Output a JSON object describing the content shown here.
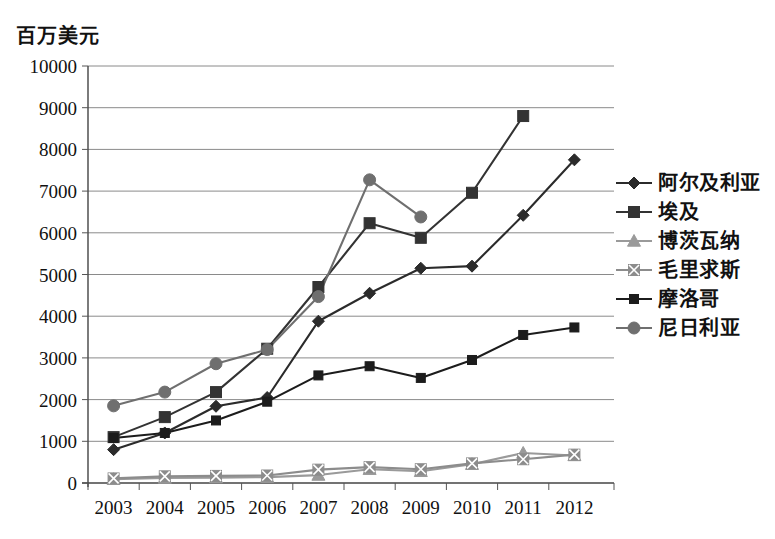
{
  "chart_data": {
    "type": "line",
    "title": "",
    "ylabel": "百万美元",
    "xlabel": "",
    "ylim": [
      0,
      10000
    ],
    "ytick_step": 1000,
    "grid": true,
    "legend_position": "right",
    "categories": [
      "2003",
      "2004",
      "2005",
      "2006",
      "2007",
      "2008",
      "2009",
      "2010",
      "2011",
      "2012"
    ],
    "yticks": [
      "0",
      "1000",
      "2000",
      "3000",
      "4000",
      "5000",
      "6000",
      "7000",
      "8000",
      "9000",
      "10000"
    ],
    "series": [
      {
        "name": "阿尔及利亚",
        "marker": "diamond",
        "color": "#2b2b2b",
        "values": [
          800,
          1200,
          1840,
          2050,
          3880,
          4550,
          5150,
          5200,
          6420,
          7750
        ]
      },
      {
        "name": "埃及",
        "marker": "square",
        "color": "#333333",
        "values": [
          1100,
          1580,
          2180,
          3220,
          4700,
          6230,
          5880,
          6960,
          8800,
          null
        ]
      },
      {
        "name": "博茨瓦纳",
        "marker": "triangle",
        "color": "#9a9a9a",
        "values": [
          90,
          120,
          130,
          140,
          190,
          330,
          280,
          450,
          720,
          660
        ]
      },
      {
        "name": "毛里求斯",
        "marker": "cross-square",
        "color": "#8c8c8c",
        "values": [
          110,
          160,
          170,
          180,
          320,
          380,
          330,
          470,
          570,
          680
        ]
      },
      {
        "name": "摩洛哥",
        "marker": "small-square",
        "color": "#1c1c1c",
        "values": [
          1080,
          1200,
          1500,
          1950,
          2580,
          2800,
          2520,
          2950,
          3550,
          3730
        ]
      },
      {
        "name": "尼日利亚",
        "marker": "circle",
        "color": "#6f6f6f",
        "values": [
          1850,
          2180,
          2860,
          3200,
          4470,
          7270,
          6380,
          null,
          null,
          null
        ]
      }
    ]
  }
}
